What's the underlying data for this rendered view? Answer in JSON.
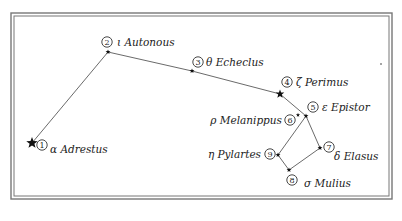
{
  "diagram": {
    "type": "constellation-map",
    "frame": {
      "outer": [
        11,
        13,
        392,
        199
      ],
      "inner_offset": 3,
      "color": "#666666"
    },
    "stars": [
      {
        "id": 1,
        "greek": "α",
        "name": "Adrestus",
        "label": "α Adrestus",
        "x": 32,
        "y": 143,
        "size": "large",
        "num_pos": [
          42,
          145
        ],
        "label_pos": [
          50,
          153
        ],
        "label_anchor": "start"
      },
      {
        "id": 2,
        "greek": "ι",
        "name": "Autonous",
        "label": "ι Autonous",
        "x": 108,
        "y": 52,
        "size": "small",
        "num_pos": [
          107,
          42
        ],
        "label_pos": [
          117,
          46
        ],
        "label_anchor": "start"
      },
      {
        "id": 3,
        "greek": "θ",
        "name": "Echeclus",
        "label": "θ Echeclus",
        "x": 192,
        "y": 71,
        "size": "small",
        "num_pos": [
          198,
          62
        ],
        "label_pos": [
          206,
          66
        ],
        "label_anchor": "start"
      },
      {
        "id": 4,
        "greek": "ζ",
        "name": "Perimus",
        "label": "ζ Perimus",
        "x": 280,
        "y": 94,
        "size": "medium",
        "num_pos": [
          287,
          82
        ],
        "label_pos": [
          296,
          86
        ],
        "label_anchor": "start"
      },
      {
        "id": 5,
        "greek": "ε",
        "name": "Epistor",
        "label": "ε Epistor",
        "x": 306,
        "y": 116,
        "size": "small",
        "num_pos": [
          313,
          107
        ],
        "label_pos": [
          322,
          111
        ],
        "label_anchor": "start"
      },
      {
        "id": 6,
        "greek": "ρ",
        "name": "Melanippus",
        "label": "ρ Melanippus",
        "x": 298,
        "y": 115,
        "size": "tiny",
        "num_pos": [
          290,
          120
        ],
        "label_pos": [
          282,
          124
        ],
        "label_anchor": "end"
      },
      {
        "id": 7,
        "greek": "δ",
        "name": "Elasus",
        "label": "δ Elasus",
        "x": 320,
        "y": 148,
        "size": "small",
        "num_pos": [
          329,
          147
        ],
        "label_pos": [
          334,
          160
        ],
        "label_anchor": "start"
      },
      {
        "id": 8,
        "greek": "σ",
        "name": "Mulius",
        "label": "σ Mulius",
        "x": 289,
        "y": 170,
        "size": "small",
        "num_pos": [
          292,
          180
        ],
        "label_pos": [
          304,
          187
        ],
        "label_anchor": "start"
      },
      {
        "id": 9,
        "greek": "η",
        "name": "Pylartes",
        "label": "η Pylartes",
        "x": 278,
        "y": 155,
        "size": "small",
        "num_pos": [
          270,
          154
        ],
        "label_pos": [
          261,
          158
        ],
        "label_anchor": "end"
      }
    ],
    "edges": [
      [
        1,
        2
      ],
      [
        2,
        3
      ],
      [
        3,
        4
      ],
      [
        4,
        5
      ],
      [
        5,
        9
      ],
      [
        9,
        8
      ],
      [
        8,
        7
      ],
      [
        7,
        5
      ]
    ],
    "stray_dots": [
      {
        "x": 381,
        "y": 64
      }
    ],
    "colors": {
      "line": "#444444",
      "star": "#111111",
      "text": "#222222",
      "background": "#ffffff"
    }
  }
}
